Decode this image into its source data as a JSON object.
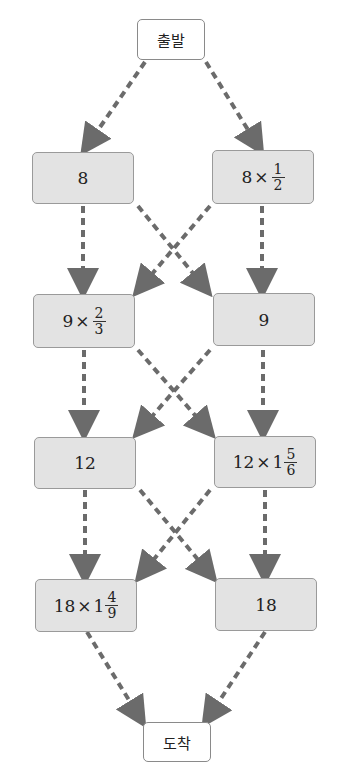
{
  "start": {
    "label": "출발"
  },
  "end": {
    "label": "도착"
  },
  "rows": [
    {
      "left": {
        "whole": "8",
        "op": "",
        "mixed": "",
        "num": "",
        "den": ""
      },
      "right": {
        "whole": "8",
        "op": "×",
        "mixed": "",
        "num": "1",
        "den": "2"
      }
    },
    {
      "left": {
        "whole": "9",
        "op": "×",
        "mixed": "",
        "num": "2",
        "den": "3"
      },
      "right": {
        "whole": "9",
        "op": "",
        "mixed": "",
        "num": "",
        "den": ""
      }
    },
    {
      "left": {
        "whole": "12",
        "op": "",
        "mixed": "",
        "num": "",
        "den": ""
      },
      "right": {
        "whole": "12",
        "op": "×",
        "mixed": "1",
        "num": "5",
        "den": "6"
      }
    },
    {
      "left": {
        "whole": "18",
        "op": "×",
        "mixed": "1",
        "num": "4",
        "den": "9"
      },
      "right": {
        "whole": "18",
        "op": "",
        "mixed": "",
        "num": "",
        "den": ""
      }
    }
  ],
  "colors": {
    "arrow": "#6b6b6b",
    "box_fill": "#e3e3e3",
    "box_border": "#9a9a9a"
  }
}
